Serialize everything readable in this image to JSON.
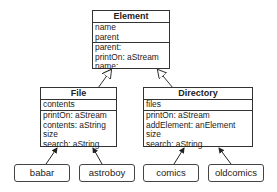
{
  "diagram": {
    "type": "uml-class-diagram",
    "classes": [
      {
        "name": "Element",
        "attributes": [
          "name",
          "parent"
        ],
        "methods": [
          "parent:",
          "printOn: aStream",
          "name:"
        ]
      },
      {
        "name": "File",
        "attributes": [
          "contents"
        ],
        "methods": [
          "printOn: aStream",
          "contents: aString",
          "size",
          "search: aString"
        ]
      },
      {
        "name": "Directory",
        "attributes": [
          "files"
        ],
        "methods": [
          "printOn: aStream",
          "addElement: anElement",
          "size",
          "search: aString"
        ]
      }
    ],
    "instances": [
      {
        "label": "babar",
        "instance_of": "File"
      },
      {
        "label": "astroboy",
        "instance_of": "File"
      },
      {
        "label": "comics",
        "instance_of": "Directory"
      },
      {
        "label": "oldcomics",
        "instance_of": "Directory"
      }
    ],
    "relations": [
      {
        "from": "File",
        "to": "Element",
        "kind": "inheritance"
      },
      {
        "from": "Directory",
        "to": "Element",
        "kind": "inheritance"
      },
      {
        "from": "babar",
        "to": "File",
        "kind": "instance-of"
      },
      {
        "from": "astroboy",
        "to": "File",
        "kind": "instance-of"
      },
      {
        "from": "comics",
        "to": "Directory",
        "kind": "instance-of"
      },
      {
        "from": "oldcomics",
        "to": "Directory",
        "kind": "instance-of"
      }
    ]
  }
}
